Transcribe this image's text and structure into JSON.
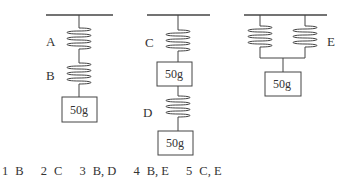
{
  "header": {
    "cutoff_text": "……………………　………　………………"
  },
  "figure": {
    "springs": {
      "A": "A",
      "B": "B",
      "C": "C",
      "D": "D",
      "E": "E"
    },
    "weights": [
      "50g",
      "50g",
      "50g",
      "50g"
    ]
  },
  "choices": [
    {
      "num": "1",
      "text": "B"
    },
    {
      "num": "2",
      "text": "C"
    },
    {
      "num": "3",
      "text": "B, D"
    },
    {
      "num": "4",
      "text": "B, E"
    },
    {
      "num": "5",
      "text": "C, E"
    }
  ]
}
